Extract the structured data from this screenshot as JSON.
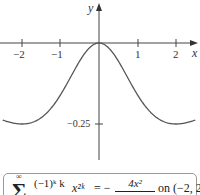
{
  "chart_data": {
    "type": "line",
    "title": "",
    "function": "f(x) = -4x^2 / (4 + x^2)^2",
    "xlabel": "x",
    "ylabel": "y",
    "x_ticks": [
      -2,
      -1,
      1,
      2
    ],
    "x_tick_labels": [
      "−2",
      "−1",
      "1",
      "2"
    ],
    "y_ticks": [
      -0.25
    ],
    "y_tick_labels": [
      "−0.25"
    ],
    "xlim": [
      -2.55,
      2.55
    ],
    "ylim": [
      -0.4,
      0.12
    ],
    "grid": false,
    "legend": null,
    "series": [
      {
        "name": "-4x^2/(4+x^2)^2",
        "x": [
          -2.5,
          -2.0,
          -1.5,
          -1.0,
          -0.5,
          0.0,
          0.5,
          1.0,
          1.5,
          2.0,
          2.5
        ],
        "y": [
          -0.2439,
          -0.25,
          -0.2304,
          -0.16,
          -0.0553,
          0.0,
          -0.0553,
          -0.16,
          -0.2304,
          -0.25,
          -0.2439
        ]
      }
    ],
    "caption_formula": "Σ_{k=1}^{∞} (−1)^k k / 4^{k−1} x^{2k} = − 4x^2 / (4 + x^2)^2 on (−2, 2)"
  },
  "axes": {
    "x_label": "x",
    "y_label": "y",
    "ticks_x": [
      {
        "label": "−2"
      },
      {
        "label": "−1"
      },
      {
        "label": "1"
      },
      {
        "label": "2"
      }
    ],
    "tick_y": {
      "label": "−0.25"
    }
  },
  "formula": {
    "sigma": "Σ",
    "sup": "∞",
    "frac1_num": "(−1)ᵏ k",
    "power": "x²ᵏ",
    "equals": "= −",
    "frac2_num": "4x²",
    "on_interval": "on (−2, 2)"
  }
}
